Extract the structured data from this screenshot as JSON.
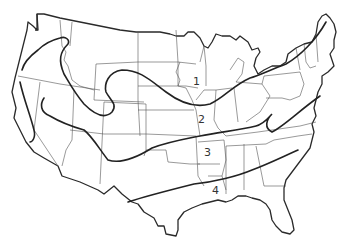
{
  "map": {
    "title": "",
    "colors": {
      "outline": "#2a2a2a",
      "state_lines": "#555555",
      "zone_lines": "#222222",
      "background": "#ffffff"
    },
    "zones": [
      {
        "id": 1,
        "label": "1",
        "x": 193,
        "y": 76
      },
      {
        "id": 2,
        "label": "2",
        "x": 198,
        "y": 114
      },
      {
        "id": 3,
        "label": "3",
        "x": 204,
        "y": 147
      },
      {
        "id": 4,
        "label": "4",
        "x": 212,
        "y": 185
      }
    ]
  }
}
